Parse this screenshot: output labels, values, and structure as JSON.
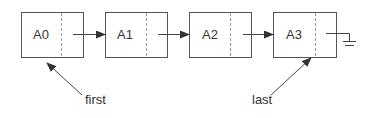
{
  "diagram": {
    "type": "linked-list",
    "nodes": [
      {
        "label": "A0"
      },
      {
        "label": "A1"
      },
      {
        "label": "A2"
      },
      {
        "label": "A3"
      }
    ],
    "pointers": [
      {
        "label": "first",
        "target": "A0"
      },
      {
        "label": "last",
        "target": "A3"
      }
    ],
    "terminator": "null-ground-symbol"
  }
}
